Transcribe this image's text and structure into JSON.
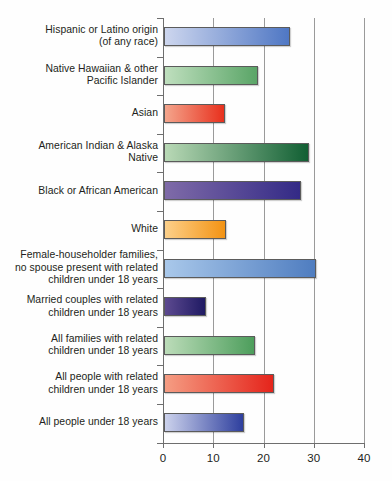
{
  "chart_data": {
    "type": "bar",
    "orientation": "horizontal",
    "title": "",
    "subtitle": "",
    "xlabel": "",
    "ylabel": "",
    "xlim": [
      0,
      40
    ],
    "xticks": [
      0,
      10,
      20,
      30,
      40
    ],
    "xtick_labels": [
      "0",
      "10",
      "20",
      "30",
      "40"
    ],
    "grid": "vertical",
    "legend": "none",
    "categories": [
      "Hispanic or Latino origin (of any race)",
      "Native Hawaiian & other Pacific Islander",
      "Asian",
      "American Indian & Alaska Native",
      "Black or African American",
      "White",
      "Female-householder families, no spouse present with related children under 18 years",
      "Married couples with related children under 18 years",
      "All families with related children under 18 years",
      "All people with related children under 18 years",
      "All people under 18 years"
    ],
    "values": [
      25.0,
      18.8,
      12.2,
      28.8,
      27.2,
      12.4,
      30.2,
      8.4,
      18.2,
      21.8,
      16.0
    ]
  },
  "axis": {
    "ticks": [
      {
        "label": "0",
        "value": 0
      },
      {
        "label": "10",
        "value": 10
      },
      {
        "label": "20",
        "value": 20
      },
      {
        "label": "30",
        "value": 30
      },
      {
        "label": "40",
        "value": 40
      }
    ]
  },
  "bars": [
    {
      "label_lines": [
        "Hispanic or Latino origin",
        "(of any race)"
      ],
      "value": 25.0,
      "color_start": "#cdd6ee",
      "color_end": "#4f77c4"
    },
    {
      "label_lines": [
        "Native Hawaiian & other",
        "Pacific Islander"
      ],
      "value": 18.8,
      "color_start": "#bfdfbe",
      "color_end": "#5aa567"
    },
    {
      "label_lines": [
        "Asian"
      ],
      "value": 12.2,
      "color_start": "#f4a58c",
      "color_end": "#e8301d"
    },
    {
      "label_lines": [
        "American Indian & Alaska",
        "Native"
      ],
      "value": 28.8,
      "color_start": "#b9d9b6",
      "color_end": "#115f33"
    },
    {
      "label_lines": [
        "Black or African American"
      ],
      "value": 27.2,
      "color_start": "#7f6ba8",
      "color_end": "#332a86"
    },
    {
      "label_lines": [
        "White"
      ],
      "value": 12.4,
      "color_start": "#fcd08a",
      "color_end": "#f39313"
    },
    {
      "label_lines": [
        "Female-householder families,",
        "no spouse present with related",
        "children under 18 years"
      ],
      "value": 30.2,
      "color_start": "#a9c8ea",
      "color_end": "#4f7dc0"
    },
    {
      "label_lines": [
        "Married couples with related",
        "children under 18 years"
      ],
      "value": 8.4,
      "color_start": "#5d4a90",
      "color_end": "#1f1a63"
    },
    {
      "label_lines": [
        "All families with related",
        "children under 18 years"
      ],
      "value": 18.2,
      "color_start": "#bcdcb9",
      "color_end": "#4d9e5c"
    },
    {
      "label_lines": [
        "All people with related",
        "children under 18 years"
      ],
      "value": 21.8,
      "color_start": "#f59d83",
      "color_end": "#e5241b"
    },
    {
      "label_lines": [
        "All people under 18 years"
      ],
      "value": 16.0,
      "color_start": "#ccd2ec",
      "color_end": "#2e3f9e"
    }
  ],
  "style": {
    "gridline_color": "#9a9a9a",
    "axis_color": "#6e6e6e",
    "text_color": "#231f20",
    "background": "#ffffff"
  }
}
